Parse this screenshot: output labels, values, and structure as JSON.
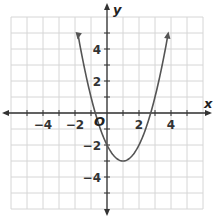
{
  "chart_data": {
    "type": "line",
    "title": "",
    "xlabel": "x",
    "ylabel": "y",
    "origin_label": "O",
    "function": "y = (x - 1)^2 - 3",
    "vertex": [
      1,
      -3
    ],
    "y_intercept": [
      0,
      -2
    ],
    "x_intercepts": [
      -0.73,
      2.73
    ],
    "x": [
      -1.8,
      -1,
      0,
      1,
      2,
      3,
      3.8
    ],
    "series": [
      {
        "name": "parabola",
        "values": [
          4.84,
          1,
          -2,
          -3,
          -2,
          1,
          4.84
        ]
      }
    ],
    "xlim": [
      -6,
      6
    ],
    "ylim": [
      -6,
      6
    ],
    "x_ticks": [
      "-4",
      "-2",
      "2",
      "4"
    ],
    "y_ticks": [
      "4",
      "2",
      "-2",
      "-4"
    ],
    "grid": true,
    "arrows_on_curve_ends": true,
    "colors": {
      "grid": "#d6d6d6",
      "axis": "#333333",
      "curve": "#555555"
    }
  }
}
